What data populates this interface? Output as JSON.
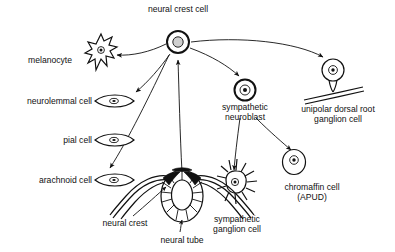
{
  "diagram": {
    "type": "biological-lineage-diagram",
    "line_color": "#111111",
    "background_color": "#ffffff"
  },
  "nodes": {
    "hub": {
      "label": "neural crest cell",
      "x": 178,
      "y": 42,
      "label_x": 178,
      "label_y": 12
    },
    "melanocyte": {
      "label": "melanocyte",
      "label_x": 72,
      "label_y": 63,
      "cell_x": 101,
      "cell_y": 52
    },
    "neurolemmal": {
      "label": "neurolemmal cell",
      "label_x": 92,
      "label_y": 104,
      "cell_x": 114,
      "cell_y": 101
    },
    "pial": {
      "label": "pial cell",
      "label_x": 92,
      "label_y": 143,
      "cell_x": 114,
      "cell_y": 140
    },
    "arachnoid": {
      "label": "arachnoid cell",
      "label_x": 92,
      "label_y": 183,
      "cell_x": 114,
      "cell_y": 180
    },
    "sympathetic_neuroblast": {
      "label_line1": "sympathetic",
      "label_line2": "neuroblast",
      "label_x": 245,
      "label_y": 110,
      "cell_x": 245,
      "cell_y": 90
    },
    "unipolar": {
      "label_line1": "unipolar dorsal root",
      "label_line2": "ganglion cell",
      "label_x": 338,
      "label_y": 112,
      "cell_x": 333,
      "cell_y": 70
    },
    "sympathetic_ganglion": {
      "label_line1": "sympathetic",
      "label_line2": "ganglion cell",
      "label_x": 237,
      "label_y": 222,
      "cell_x": 235,
      "cell_y": 186
    },
    "chromaffin": {
      "label_line1": "chromaffin cell",
      "label_line2": "(APUD)",
      "label_x": 312,
      "label_y": 190,
      "cell_x": 294,
      "cell_y": 162
    },
    "neural_crest": {
      "label": "neural crest",
      "label_x": 125,
      "label_y": 226
    },
    "neural_tube": {
      "label": "neural tube",
      "label_x": 182,
      "label_y": 243
    }
  },
  "edges": [
    {
      "from": "hub",
      "to": "melanocyte"
    },
    {
      "from": "hub",
      "to": "neurolemmal"
    },
    {
      "from": "hub",
      "to": "arachnoid"
    },
    {
      "from": "neural_tube",
      "to": "hub"
    },
    {
      "from": "hub",
      "to": "sympathetic_neuroblast"
    },
    {
      "from": "hub",
      "to": "unipolar"
    },
    {
      "from": "sympathetic_neuroblast",
      "to": "sympathetic_ganglion"
    },
    {
      "from": "sympathetic_neuroblast",
      "to": "chromaffin"
    }
  ]
}
